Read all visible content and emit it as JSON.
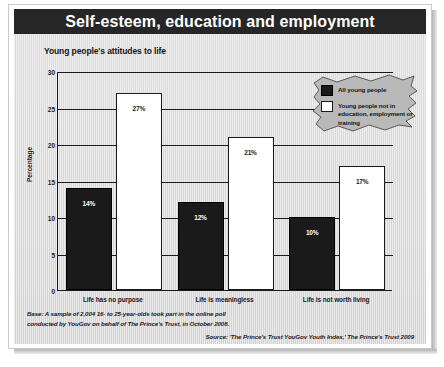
{
  "header": {
    "title": "Self-esteem, education and employment"
  },
  "chart_data": {
    "type": "bar",
    "title": "Young people's attitudes to life",
    "xlabel": "",
    "ylabel": "Percentage",
    "ylim": [
      0,
      30
    ],
    "yticks": [
      0,
      5,
      10,
      15,
      20,
      25,
      30
    ],
    "ytick_labels": [
      "0",
      "5",
      "10",
      "15",
      "20",
      "25",
      "30"
    ],
    "grid": true,
    "legend_position": "top-right",
    "categories": [
      "Life has no purpose",
      "Life is meaningless",
      "Life is not worth living"
    ],
    "series": [
      {
        "name": "All young people",
        "color": "#1a1a1a",
        "values": [
          14,
          12,
          10
        ],
        "data_labels": [
          "14%",
          "12%",
          "10%"
        ]
      },
      {
        "name": "Young people not in education, employment or training",
        "color": "#ffffff",
        "values": [
          27,
          21,
          17
        ],
        "data_labels": [
          "27%",
          "21%",
          "17%"
        ]
      }
    ]
  },
  "notes": {
    "base_line1": "Base: A sample of 2,004 16- to 25-year-olds took part in the online poll",
    "base_line2": "conducted by YouGov on behalf of The Prince's Trust, in October 2008.",
    "source": "Source: 'The Prince's Trust YouGov Youth Index,' The Prince's Trust 2009"
  }
}
